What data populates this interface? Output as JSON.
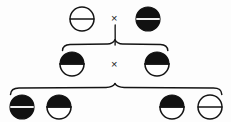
{
  "diagram": {
    "background_color": "#fdfdfd",
    "ink_color": "#111111",
    "fill_black": "#111111",
    "fill_white": "#ffffff",
    "cross_symbol": "×",
    "generations": [
      {
        "name": "parental-generation",
        "label": "P",
        "row_y": 19,
        "cross_symbol": "×",
        "cross_x": 115,
        "individuals": [
          {
            "id": "p1",
            "name": "parent-left",
            "phenotype": "open",
            "top_half": "white",
            "bottom_half": "white",
            "cx": 82,
            "cy": 19,
            "r": 12
          },
          {
            "id": "p2",
            "name": "parent-right",
            "phenotype": "filled",
            "top_half": "black",
            "bottom_half": "black",
            "cx": 148,
            "cy": 19,
            "r": 12
          }
        ]
      },
      {
        "name": "f1-generation",
        "label": "F1",
        "row_y": 64,
        "cross_symbol": "×",
        "cross_x": 115,
        "individuals": [
          {
            "id": "f1a",
            "name": "f1-left",
            "phenotype": "half-filled",
            "top_half": "black",
            "bottom_half": "white",
            "cx": 72,
            "cy": 64,
            "r": 12
          },
          {
            "id": "f1b",
            "name": "f1-right",
            "phenotype": "half-filled",
            "top_half": "black",
            "bottom_half": "white",
            "cx": 157,
            "cy": 64,
            "r": 12
          }
        ]
      },
      {
        "name": "f2-generation",
        "label": "F2",
        "row_y": 107,
        "individuals": [
          {
            "id": "f2a",
            "name": "f2-offspring-1",
            "phenotype": "filled",
            "top_half": "black",
            "bottom_half": "black",
            "cx": 22,
            "cy": 107,
            "r": 12
          },
          {
            "id": "f2b",
            "name": "f2-offspring-2",
            "phenotype": "half-filled",
            "top_half": "black",
            "bottom_half": "white",
            "cx": 59,
            "cy": 107,
            "r": 12
          },
          {
            "id": "f2c",
            "name": "f2-offspring-3",
            "phenotype": "half-filled",
            "top_half": "black",
            "bottom_half": "white",
            "cx": 172,
            "cy": 107,
            "r": 12
          },
          {
            "id": "f2d",
            "name": "f2-offspring-4",
            "phenotype": "open",
            "top_half": "white",
            "bottom_half": "white",
            "cx": 210,
            "cy": 107,
            "r": 12
          }
        ]
      }
    ],
    "connectors": [
      {
        "name": "parental-descent-line",
        "type": "vertical-line",
        "x": 115,
        "y_start": 24,
        "y_end": 45
      },
      {
        "name": "f1-brace",
        "type": "curly-brace",
        "left_x": 62,
        "right_x": 168,
        "apex_x": 115,
        "apex_y": 40,
        "baseline_y": 48
      },
      {
        "name": "f2-brace",
        "type": "curly-brace",
        "left_x": 10,
        "right_x": 222,
        "apex_x": 115,
        "apex_y": 84,
        "baseline_y": 92
      }
    ]
  }
}
